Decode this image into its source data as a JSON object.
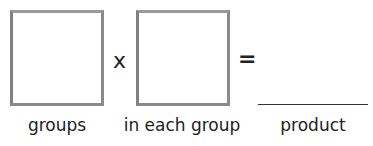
{
  "equation": {
    "factor1": {
      "value": "",
      "label": "groups"
    },
    "operator": "x",
    "factor2": {
      "value": "",
      "label": "in each group"
    },
    "equals": "=",
    "product": {
      "value": "",
      "label": "product"
    }
  }
}
